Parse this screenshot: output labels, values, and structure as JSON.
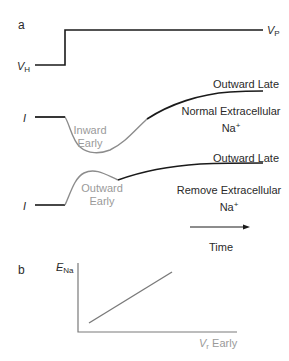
{
  "panel_a": {
    "label": "a",
    "voltage": {
      "holding_label": "V",
      "holding_sub": "H",
      "step_label": "V",
      "step_sub": "P"
    },
    "trace_normal": {
      "current_label": "I",
      "early_line1": "Inward",
      "early_line2": "Early",
      "late_label": "Outward Late",
      "condition_line1": "Normal Extracellular",
      "condition_line2": "Na",
      "condition_sup": "+"
    },
    "trace_removed": {
      "current_label": "I",
      "early_line1": "Outward",
      "early_line2": "Early",
      "late_label": "Outward Late",
      "condition_line1": "Remove Extracellular",
      "condition_line2": "Na",
      "condition_sup": "+"
    },
    "time_label": "Time"
  },
  "panel_b": {
    "label": "b",
    "ylabel": "E",
    "ylabel_sub": "Na",
    "xlabel_var": "V",
    "xlabel_sub": "r",
    "xlabel_rest": " Early"
  },
  "colors": {
    "trace_black": "#1a1a1a",
    "trace_gray": "#8c8c8c",
    "text_gray": "#9a9a9a",
    "axis_gray": "#7a7a7a"
  }
}
